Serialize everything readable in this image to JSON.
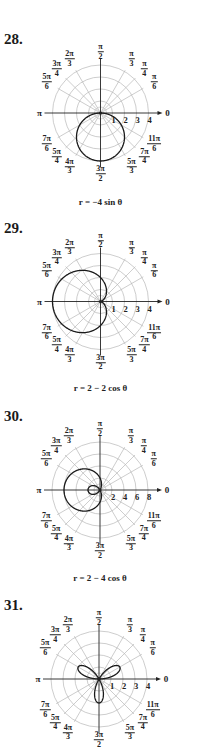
{
  "chart_data": [
    {
      "type": "polar",
      "number": "28.",
      "equation": "r = −4 sin θ",
      "center": [
        100.5,
        113
      ],
      "px_per_unit": 12,
      "ring_count": 4,
      "radial_ticks": [
        "1",
        "2",
        "3",
        "4"
      ],
      "curve": {
        "kind": "sin",
        "a": 0,
        "b": -4,
        "k": 1
      },
      "caption_y": 203
    },
    {
      "type": "polar",
      "number": "29.",
      "equation": "r = 2 − 2 cos θ",
      "center": [
        100.5,
        301.5
      ],
      "px_per_unit": 12,
      "ring_count": 4,
      "radial_ticks": [
        "1",
        "2",
        "3",
        "4"
      ],
      "curve": {
        "kind": "cos",
        "a": 2,
        "b": -2,
        "k": 1
      },
      "caption_y": 389
    },
    {
      "type": "polar",
      "number": "30.",
      "equation": "r = 2 − 4 cos θ",
      "center": [
        100,
        490
      ],
      "px_per_unit": 6,
      "ring_count": 4,
      "radial_ticks": [
        "2",
        "4",
        "6",
        "8"
      ],
      "curve": {
        "kind": "cos",
        "a": 2,
        "b": -4,
        "k": 1
      },
      "caption_y": 579
    },
    {
      "type": "polar",
      "number": "31.",
      "equation": "",
      "center": [
        99,
        679
      ],
      "px_per_unit": 12,
      "ring_count": 4,
      "radial_ticks": [
        "1",
        "2",
        "3",
        "4"
      ],
      "curve": {
        "kind": "sin",
        "a": 0,
        "b": 2,
        "k": 3
      },
      "caption_y": null
    }
  ],
  "angle_labels": [
    {
      "deg": 90,
      "n": "π",
      "d": "2"
    },
    {
      "deg": 60,
      "n": "π",
      "d": "3"
    },
    {
      "deg": 45,
      "n": "π",
      "d": "4"
    },
    {
      "deg": 30,
      "n": "π",
      "d": "6"
    },
    {
      "deg": 120,
      "n": "2π",
      "d": "3"
    },
    {
      "deg": 135,
      "n": "3π",
      "d": "4"
    },
    {
      "deg": 150,
      "n": "5π",
      "d": "6"
    },
    {
      "deg": 210,
      "n": "7π",
      "d": "6"
    },
    {
      "deg": 225,
      "n": "5π",
      "d": "4"
    },
    {
      "deg": 240,
      "n": "4π",
      "d": "3"
    },
    {
      "deg": 270,
      "n": "3π",
      "d": "2"
    },
    {
      "deg": 300,
      "n": "5π",
      "d": "3"
    },
    {
      "deg": 315,
      "n": "7π",
      "d": "4"
    },
    {
      "deg": 330,
      "n": "11π",
      "d": "6"
    }
  ],
  "axis_labels": {
    "zero": "0",
    "pi": "π"
  },
  "colors": {
    "grid": "#b8b8b8",
    "axis": "#222222",
    "curve": "#1a1a1a"
  }
}
